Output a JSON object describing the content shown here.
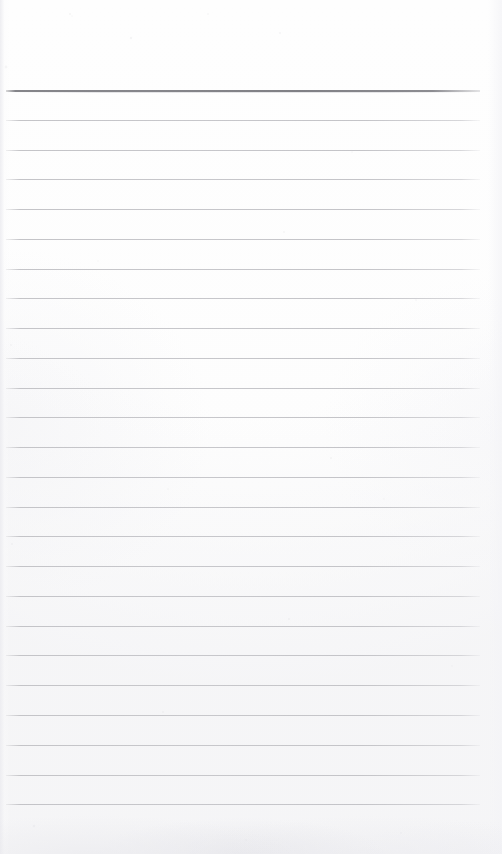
{
  "document": {
    "kind": "scanned-blank-ruled-paper",
    "title": "",
    "body_text": "",
    "page_width": 502,
    "page_height": 854,
    "paper_color": "#fdfdfd",
    "rule_color": "#c7c7cb",
    "header_rule_color": "#83838a",
    "top_margin": 90,
    "bottom_margin": 50,
    "left_inset": 6,
    "right_inset": 22,
    "line_spacing": 29.75,
    "line_count": 25,
    "header_rule_index": 0,
    "rules": [
      {
        "index": 0,
        "y": 90,
        "weight": "heavy",
        "x_start": 6,
        "x_end": 480
      },
      {
        "index": 1,
        "y": 120,
        "weight": "light",
        "x_start": 6,
        "x_end": 480
      },
      {
        "index": 2,
        "y": 150,
        "weight": "light",
        "x_start": 6,
        "x_end": 480
      },
      {
        "index": 3,
        "y": 179,
        "weight": "light",
        "x_start": 6,
        "x_end": 480
      },
      {
        "index": 4,
        "y": 209,
        "weight": "light",
        "x_start": 6,
        "x_end": 480
      },
      {
        "index": 5,
        "y": 239,
        "weight": "light",
        "x_start": 6,
        "x_end": 480
      },
      {
        "index": 6,
        "y": 269,
        "weight": "light",
        "x_start": 6,
        "x_end": 480
      },
      {
        "index": 7,
        "y": 298,
        "weight": "light",
        "x_start": 6,
        "x_end": 480
      },
      {
        "index": 8,
        "y": 328,
        "weight": "light",
        "x_start": 6,
        "x_end": 480
      },
      {
        "index": 9,
        "y": 358,
        "weight": "light",
        "x_start": 6,
        "x_end": 480
      },
      {
        "index": 10,
        "y": 388,
        "weight": "light",
        "x_start": 6,
        "x_end": 480
      },
      {
        "index": 11,
        "y": 417,
        "weight": "light",
        "x_start": 6,
        "x_end": 480
      },
      {
        "index": 12,
        "y": 447,
        "weight": "light",
        "x_start": 6,
        "x_end": 480
      },
      {
        "index": 13,
        "y": 477,
        "weight": "light",
        "x_start": 6,
        "x_end": 480
      },
      {
        "index": 14,
        "y": 507,
        "weight": "light",
        "x_start": 6,
        "x_end": 480
      },
      {
        "index": 15,
        "y": 536,
        "weight": "light",
        "x_start": 6,
        "x_end": 480
      },
      {
        "index": 16,
        "y": 566,
        "weight": "light",
        "x_start": 6,
        "x_end": 480
      },
      {
        "index": 17,
        "y": 596,
        "weight": "light",
        "x_start": 6,
        "x_end": 480
      },
      {
        "index": 18,
        "y": 626,
        "weight": "light",
        "x_start": 6,
        "x_end": 480
      },
      {
        "index": 19,
        "y": 655,
        "weight": "light",
        "x_start": 6,
        "x_end": 480
      },
      {
        "index": 20,
        "y": 685,
        "weight": "light",
        "x_start": 6,
        "x_end": 480
      },
      {
        "index": 21,
        "y": 715,
        "weight": "light",
        "x_start": 6,
        "x_end": 480
      },
      {
        "index": 22,
        "y": 745,
        "weight": "light",
        "x_start": 6,
        "x_end": 480
      },
      {
        "index": 23,
        "y": 775,
        "weight": "light",
        "x_start": 6,
        "x_end": 480
      },
      {
        "index": 24,
        "y": 804,
        "weight": "light",
        "x_start": 6,
        "x_end": 480
      }
    ],
    "speckles": [
      {
        "x": 70,
        "y": 14,
        "r": 1.0,
        "o": 0.3
      },
      {
        "x": 72,
        "y": 16,
        "r": 0.8,
        "o": 0.22
      },
      {
        "x": 131,
        "y": 38,
        "r": 1.2,
        "o": 0.26
      },
      {
        "x": 208,
        "y": 14,
        "r": 0.9,
        "o": 0.2
      },
      {
        "x": 280,
        "y": 33,
        "r": 1.1,
        "o": 0.24
      },
      {
        "x": 6,
        "y": 67,
        "r": 1.4,
        "o": 0.22
      },
      {
        "x": 352,
        "y": 152,
        "r": 0.9,
        "o": 0.18
      },
      {
        "x": 284,
        "y": 232,
        "r": 1.0,
        "o": 0.22
      },
      {
        "x": 98,
        "y": 261,
        "r": 0.8,
        "o": 0.18
      },
      {
        "x": 416,
        "y": 300,
        "r": 1.0,
        "o": 0.18
      },
      {
        "x": 11,
        "y": 345,
        "r": 1.1,
        "o": 0.2
      },
      {
        "x": 331,
        "y": 458,
        "r": 1.0,
        "o": 0.22
      },
      {
        "x": 168,
        "y": 489,
        "r": 0.9,
        "o": 0.18
      },
      {
        "x": 384,
        "y": 499,
        "r": 0.9,
        "o": 0.16
      },
      {
        "x": 12,
        "y": 544,
        "r": 1.2,
        "o": 0.2
      },
      {
        "x": 289,
        "y": 619,
        "r": 1.1,
        "o": 0.24
      },
      {
        "x": 163,
        "y": 712,
        "r": 1.0,
        "o": 0.2
      },
      {
        "x": 452,
        "y": 666,
        "r": 0.9,
        "o": 0.16
      },
      {
        "x": 34,
        "y": 826,
        "r": 1.3,
        "o": 0.22
      },
      {
        "x": 246,
        "y": 840,
        "r": 1.1,
        "o": 0.2
      },
      {
        "x": 401,
        "y": 833,
        "r": 1.0,
        "o": 0.18
      }
    ]
  }
}
